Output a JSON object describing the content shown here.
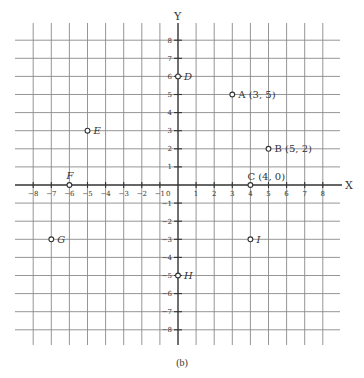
{
  "diagram": {
    "type": "cartesian-plane",
    "caption": "(b)",
    "x_axis_label": "X",
    "y_axis_label": "Y",
    "origin_label": "0",
    "x_range": [
      -8,
      8
    ],
    "y_range": [
      -8,
      8
    ],
    "x_ticks": [
      "-8",
      "-7",
      "-6",
      "-5",
      "-4",
      "-3",
      "-2",
      "-1",
      "1",
      "2",
      "3",
      "4",
      "5",
      "6",
      "7",
      "8"
    ],
    "y_ticks": [
      "8",
      "7",
      "6",
      "5",
      "4",
      "3",
      "2",
      "1",
      "-1",
      "-2",
      "-3",
      "-4",
      "-5",
      "-6",
      "-7",
      "-8"
    ],
    "colors": {
      "grid": "#8a8a8a",
      "axis": "#333333",
      "text": "#333333",
      "background": "#ffffff"
    },
    "points": [
      {
        "name": "A",
        "label": "A (3, 5)",
        "x": 3,
        "y": 5,
        "italic": false
      },
      {
        "name": "B",
        "label": "B (5, 2)",
        "x": 5,
        "y": 2,
        "italic": false
      },
      {
        "name": "C",
        "label": "C (4, 0)",
        "x": 4,
        "y": 0,
        "italic": false
      },
      {
        "name": "D",
        "label": "D",
        "x": 0,
        "y": 6,
        "italic": true
      },
      {
        "name": "E",
        "label": "E",
        "x": -5,
        "y": 3,
        "italic": true
      },
      {
        "name": "F",
        "label": "F",
        "x": -6,
        "y": 0,
        "italic": true
      },
      {
        "name": "G",
        "label": "G",
        "x": -7,
        "y": -3,
        "italic": true
      },
      {
        "name": "H",
        "label": "H",
        "x": 0,
        "y": -5,
        "italic": true
      },
      {
        "name": "I",
        "label": "I",
        "x": 4,
        "y": -3,
        "italic": true
      }
    ]
  }
}
